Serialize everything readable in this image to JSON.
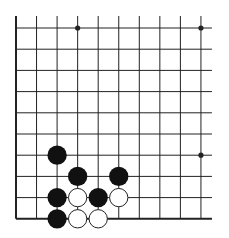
{
  "diagram": {
    "type": "go-board-fragment",
    "grid": {
      "columns": 10,
      "rows": 10,
      "origin_x": 16,
      "origin_y": 28,
      "spacing_x": 20.55,
      "spacing_y": 21.2,
      "extend_right": 11,
      "extend_top": 12,
      "edges": [
        "left",
        "bottom"
      ],
      "line_color": "#222222",
      "edge_line_width": 2,
      "inner_line_width": 1
    },
    "star_points": [
      {
        "col": 3,
        "row": 0
      },
      {
        "col": 9,
        "row": 0
      },
      {
        "col": 9,
        "row": 6
      }
    ],
    "stones": [
      {
        "color": "black",
        "col": 2,
        "row": 6
      },
      {
        "color": "black",
        "col": 3,
        "row": 7
      },
      {
        "color": "black",
        "col": 5,
        "row": 7
      },
      {
        "color": "black",
        "col": 2,
        "row": 8
      },
      {
        "color": "white",
        "col": 3,
        "row": 8
      },
      {
        "color": "black",
        "col": 4,
        "row": 8
      },
      {
        "color": "white",
        "col": 5,
        "row": 8
      },
      {
        "color": "black",
        "col": 2,
        "row": 9
      },
      {
        "color": "white",
        "col": 3,
        "row": 9
      },
      {
        "color": "white",
        "col": 4,
        "row": 9
      }
    ],
    "colors": {
      "black_stone": "#111111",
      "white_stone_fill": "#ffffff",
      "white_stone_stroke": "#222222",
      "background": "#ffffff"
    }
  }
}
